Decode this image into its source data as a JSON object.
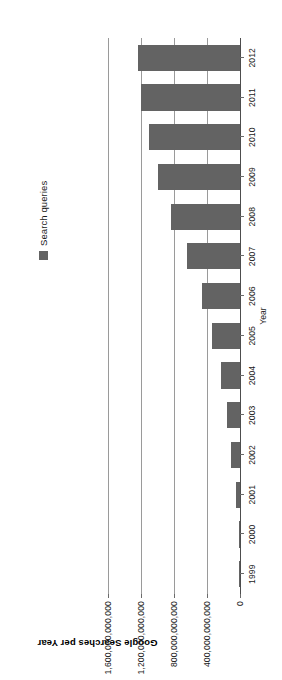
{
  "chart_data": {
    "type": "bar",
    "title": "Google Searches per Year",
    "xlabel": "Year",
    "ylabel": "",
    "grid": true,
    "legend_position": "top-right",
    "orientation": "vertical",
    "bar_color": "#636363",
    "categories": [
      "1999",
      "2000",
      "2001",
      "2002",
      "2003",
      "2004",
      "2005",
      "2006",
      "2007",
      "2008",
      "2009",
      "2010",
      "2011",
      "2012"
    ],
    "series": [
      {
        "name": "Search queries",
        "values": [
          1000000000,
          14000000000,
          46000000000,
          105000000000,
          160000000000,
          230000000000,
          340000000000,
          465000000000,
          640000000000,
          840000000000,
          990000000000,
          1100000000000,
          1200000000000,
          1240000000000
        ]
      }
    ],
    "ylim": [
      0,
      1700000000000
    ],
    "yticks": [
      0,
      400000000000,
      800000000000,
      1200000000000,
      1600000000000
    ],
    "ytick_labels": [
      "0",
      "400,000,000,000",
      "800,000,000,000",
      "1,200,000,000,000",
      "1,600,000,000,000"
    ]
  },
  "legend": {
    "entries": [
      {
        "label": "Search queries",
        "color": "#636363",
        "marker": "square-swatch"
      }
    ]
  }
}
